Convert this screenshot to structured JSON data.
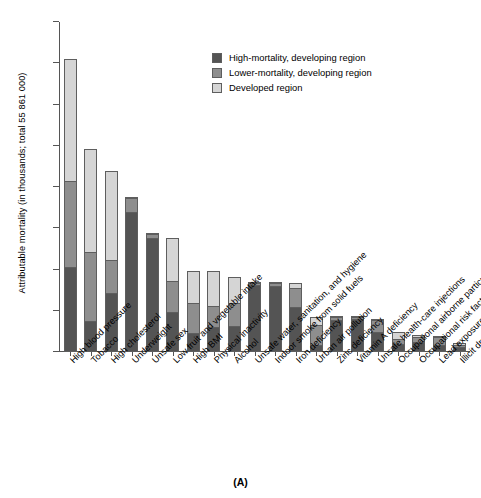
{
  "caption": "(A)",
  "top_fragment": "",
  "legend": {
    "position": "upper-center",
    "items": [
      {
        "label": "High-mortality, developing region",
        "color": "#545454",
        "key": "high_mortality_developing"
      },
      {
        "label": "Lower-mortality, developing region",
        "color": "#8e8e8e",
        "key": "lower_mortality_developing"
      },
      {
        "label": "Developed region",
        "color": "#d5d5d5",
        "key": "developed"
      }
    ]
  },
  "chart_data": {
    "type": "bar",
    "stacked": true,
    "title": "",
    "subtitle": "",
    "xlabel": "",
    "ylabel": "Attributable mortality (in thousands; total 55 861 000)",
    "ylim": [
      0,
      8000
    ],
    "yticks": [
      0,
      1000,
      2000,
      3000,
      4000,
      5000,
      6000,
      7000,
      8000
    ],
    "ytick_labels": [
      "0",
      "1000",
      "2000",
      "3000",
      "4000",
      "5000",
      "6000",
      "7000",
      "8000"
    ],
    "grid": false,
    "legend_position": "upper-center",
    "categories": [
      "High blood pressure",
      "Tobacco",
      "High cholesterol",
      "Underweight",
      "Unsafe sex",
      "Low fruit and vegetable intake",
      "High BMI",
      "Physical inactivity",
      "Alcohol",
      "Unsafe water, sanitation, and hygiene",
      "Indoor smoke from solid fuels",
      "Iron deficiency",
      "Urban air pollution",
      "Zinc deficiency",
      "Vitamin A deficiency",
      "Unsafe health-care injections",
      "Occupational airborne particulates",
      "Occupational risk factors for injury",
      "Lead exposure",
      "Illicit drugs"
    ],
    "series": [
      {
        "name": "High-mortality, developing region",
        "color": "#545454",
        "values": [
          2050,
          740,
          1420,
          3400,
          2770,
          960,
          460,
          600,
          620,
          1620,
          1610,
          1100,
          180,
          780,
          800,
          490,
          200,
          250,
          170,
          110
        ]
      },
      {
        "name": "Lower-mortality, developing region",
        "color": "#8e8e8e",
        "values": [
          2100,
          1690,
          800,
          330,
          90,
          760,
          720,
          510,
          580,
          60,
          60,
          460,
          480,
          70,
          50,
          290,
          120,
          110,
          190,
          60
        ]
      },
      {
        "name": "Developed region",
        "color": "#d5d5d5",
        "values": [
          2950,
          2480,
          2160,
          20,
          20,
          1040,
          780,
          860,
          620,
          20,
          10,
          110,
          200,
          10,
          10,
          30,
          170,
          60,
          10,
          60
        ]
      }
    ],
    "totals": [
      7100,
      4910,
      4380,
      3750,
      2880,
      2760,
      1960,
      1970,
      1820,
      1700,
      1680,
      1670,
      860,
      860,
      860,
      810,
      490,
      420,
      370,
      230
    ]
  }
}
